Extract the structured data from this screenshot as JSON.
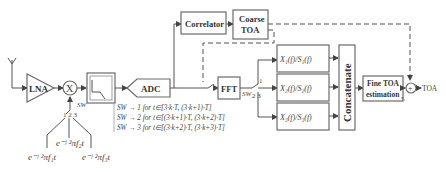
{
  "blocks": {
    "lna": "LNA",
    "mixer": "X",
    "adc": "ADC",
    "correlator": "Correlator",
    "coarse_toa_line1": "Coarse",
    "coarse_toa_line2": "TOA",
    "fft": "FFT",
    "ratio1": "X₁(f)/S₁(f)",
    "ratio2": "X₂(f)/S₂(f)",
    "ratio3": "X₃(f)/S₃(f)",
    "concatenate": "Concatenate",
    "fine_toa_line1": "Fine TOA",
    "fine_toa_line2": "estimation",
    "adder": "+",
    "output": "TOA"
  },
  "switch": {
    "sw_label_left": "SW",
    "sw_positions_left": "1 2 3",
    "sw_label_right": "SW",
    "sw_pos1": "1",
    "sw_pos23": "2  3"
  },
  "oscillators": {
    "osc1": "e⁻ʲ ²πf₁t",
    "osc2": "e⁻ʲ ²πf₂t",
    "osc3": "e⁻ʲ ²πf₃t"
  },
  "switch_rules": [
    "SW → 1   for  t∈[3·k·T, (3·k+1)·T]",
    "SW → 2   for  t∈[(3·k+1)·T, (3·k+2)·T]",
    "SW → 3   for  t∈[(3·k+2)·T, (3·k+3)·T]"
  ],
  "adder_input_label": "τ₁"
}
